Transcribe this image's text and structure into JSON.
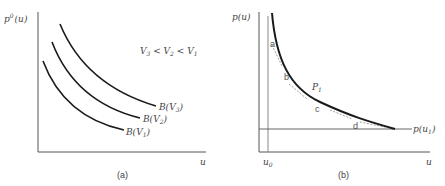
{
  "panel_a": {
    "y_label": "p",
    "y_label_sup": "0",
    "y_label_arg": "(u)",
    "x_label": "u",
    "caption": "(a)",
    "relation": {
      "v3": "V",
      "v3_sub": "3",
      "lt1": " < ",
      "v2": "V",
      "v2_sub": "2",
      "lt2": " < ",
      "v1": "V",
      "v1_sub": "1"
    },
    "curves": [
      {
        "label": "B(V",
        "sub": "3",
        "close": ")"
      },
      {
        "label": "B(V",
        "sub": "2",
        "close": ")"
      },
      {
        "label": "B(V",
        "sub": "1",
        "close": ")"
      }
    ]
  },
  "panel_b": {
    "y_label": "p(u)",
    "x_label": "u",
    "x_marker": "u",
    "x_marker_sub": "0",
    "h_line_label": "p(u",
    "h_line_sub": "1",
    "h_line_close": ")",
    "point_label": "P",
    "point_sub": "1",
    "segments": [
      "a",
      "b",
      "c",
      "d"
    ],
    "caption": "(b)"
  },
  "colors": {
    "axis": "#555555",
    "curve": "#1a1a1a",
    "tangent": "#888888"
  }
}
